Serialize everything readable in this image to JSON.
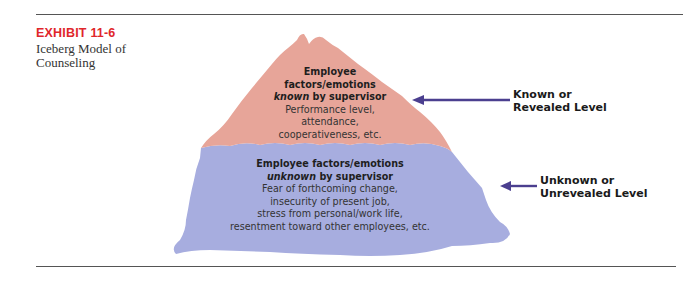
{
  "exhibit": {
    "number": "EXHIBIT 11-6",
    "title": "Iceberg Model of Counseling"
  },
  "colors": {
    "exhibit_red": "#e0262b",
    "known_fill": "#e7a599",
    "unknown_fill": "#a7addf",
    "arrow": "#4b3f8f"
  },
  "known": {
    "heading_line1": "Employee",
    "heading_line2": "factors/emotions",
    "heading_em": "known",
    "heading_rest": " by supervisor",
    "body": [
      "Performance level,",
      "attendance,",
      "cooperativeness, etc."
    ]
  },
  "unknown": {
    "heading_line1": "Employee factors/emotions",
    "heading_em": "unknown",
    "heading_rest": " by supervisor",
    "body": [
      "Fear of forthcoming change,",
      "insecurity of present job,",
      "stress from personal/work life,",
      "resentment toward other employees, etc."
    ]
  },
  "labels": {
    "known_line1": "Known or",
    "known_line2": "Revealed Level",
    "unknown_line1": "Unknown or",
    "unknown_line2": "Unrevealed Level"
  }
}
